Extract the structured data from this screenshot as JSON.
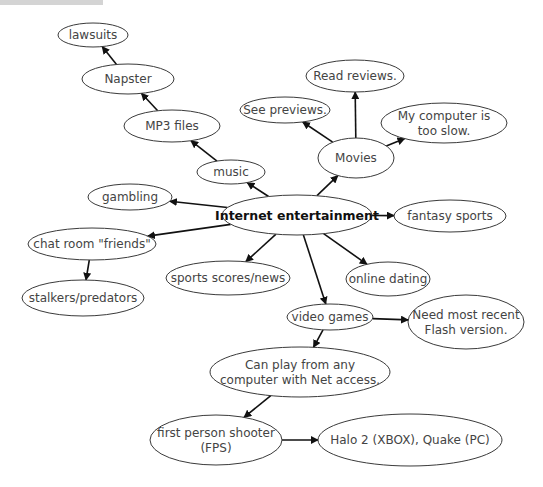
{
  "diagram": {
    "type": "concept-map",
    "nodes": [
      {
        "id": "internet",
        "lines": [
          "Internet entertainment"
        ],
        "main": true
      },
      {
        "id": "music",
        "lines": [
          "music"
        ]
      },
      {
        "id": "mp3",
        "lines": [
          "MP3 files"
        ]
      },
      {
        "id": "napster",
        "lines": [
          "Napster"
        ]
      },
      {
        "id": "lawsuits",
        "lines": [
          "lawsuits"
        ]
      },
      {
        "id": "movies",
        "lines": [
          "Movies"
        ]
      },
      {
        "id": "previews",
        "lines": [
          "See previews."
        ]
      },
      {
        "id": "reviews",
        "lines": [
          "Read reviews."
        ]
      },
      {
        "id": "slow",
        "lines": [
          "My computer is",
          "too slow."
        ]
      },
      {
        "id": "gambling",
        "lines": [
          "gambling"
        ]
      },
      {
        "id": "chat",
        "lines": [
          "chat room \"friends\""
        ]
      },
      {
        "id": "stalkers",
        "lines": [
          "stalkers/predators"
        ]
      },
      {
        "id": "sports",
        "lines": [
          "sports scores/news"
        ]
      },
      {
        "id": "fantasy",
        "lines": [
          "fantasy sports"
        ]
      },
      {
        "id": "dating",
        "lines": [
          "online dating"
        ]
      },
      {
        "id": "videogames",
        "lines": [
          "video games"
        ]
      },
      {
        "id": "flash",
        "lines": [
          "Need most recent",
          "Flash version."
        ]
      },
      {
        "id": "anycomputer",
        "lines": [
          "Can play from any",
          "computer with Net access."
        ]
      },
      {
        "id": "fps",
        "lines": [
          "first person shooter",
          "(FPS)"
        ]
      },
      {
        "id": "halo",
        "lines": [
          "Halo 2 (XBOX), Quake (PC)"
        ]
      }
    ],
    "edges": [
      {
        "from": "internet",
        "to": "music"
      },
      {
        "from": "music",
        "to": "mp3"
      },
      {
        "from": "mp3",
        "to": "napster"
      },
      {
        "from": "napster",
        "to": "lawsuits"
      },
      {
        "from": "internet",
        "to": "movies"
      },
      {
        "from": "movies",
        "to": "previews"
      },
      {
        "from": "movies",
        "to": "reviews"
      },
      {
        "from": "movies",
        "to": "slow"
      },
      {
        "from": "internet",
        "to": "gambling"
      },
      {
        "from": "internet",
        "to": "chat"
      },
      {
        "from": "chat",
        "to": "stalkers"
      },
      {
        "from": "internet",
        "to": "sports"
      },
      {
        "from": "internet",
        "to": "fantasy"
      },
      {
        "from": "internet",
        "to": "dating"
      },
      {
        "from": "internet",
        "to": "videogames"
      },
      {
        "from": "videogames",
        "to": "flash"
      },
      {
        "from": "videogames",
        "to": "anycomputer"
      },
      {
        "from": "anycomputer",
        "to": "fps"
      },
      {
        "from": "fps",
        "to": "halo"
      }
    ]
  }
}
